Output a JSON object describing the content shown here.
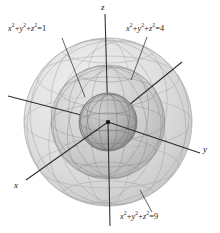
{
  "figure": {
    "background_color": "#ffffff",
    "origin": {
      "x": 108,
      "y": 122,
      "label": "origin-dot"
    },
    "axes": [
      {
        "name": "x",
        "label": "x",
        "label_x": 14,
        "label_y": 180,
        "x1": 182,
        "y1": 62,
        "x2": 26,
        "y2": 180,
        "color": "#2b2b2b"
      },
      {
        "name": "y",
        "label": "y",
        "label_x": 203,
        "label_y": 144,
        "x1": 8,
        "y1": 96,
        "x2": 200,
        "y2": 153,
        "color": "#2b2b2b"
      },
      {
        "name": "z",
        "label": "z",
        "label_x": 101,
        "label_y": 2,
        "x1": 105,
        "y1": 14,
        "x2": 110,
        "y2": 226,
        "color": "#2b2b2b"
      }
    ],
    "spheres": [
      {
        "name": "sphere-inner",
        "radius_value": 1,
        "pixel_radius": 29,
        "fill": "#a9a9a9",
        "opacity": 0.55,
        "stroke": "#6f6f6f"
      },
      {
        "name": "sphere-middle",
        "radius_value": 2,
        "pixel_radius": 57,
        "fill": "#c8c8c8",
        "opacity": 0.4,
        "stroke": "#8a8a8a"
      },
      {
        "name": "sphere-outer",
        "radius_value": 3,
        "pixel_radius": 84,
        "fill": "#dcdcdc",
        "opacity": 0.34,
        "stroke": "#9a9a9a"
      }
    ],
    "labels": [
      {
        "name": "equation-sphere-1",
        "var1": "x",
        "var2": "y",
        "var3": "z",
        "exp": "2",
        "plus": "+",
        "equals": "=",
        "value": "1",
        "leader": {
          "x1": 62,
          "y1": 38,
          "x2": 85,
          "y2": 97
        }
      },
      {
        "name": "equation-sphere-4",
        "var1": "x",
        "var2": "y",
        "var3": "z",
        "exp": "2",
        "plus": "+",
        "equals": "=",
        "value": "4",
        "leader": {
          "x1": 147,
          "y1": 37,
          "x2": 131,
          "y2": 80
        }
      },
      {
        "name": "equation-sphere-9",
        "var1": "x",
        "var2": "y",
        "var3": "z",
        "exp": "2",
        "plus": "+",
        "equals": "=",
        "value": "9",
        "leader": {
          "x1": 152,
          "y1": 212,
          "x2": 140,
          "y2": 190
        }
      }
    ]
  }
}
